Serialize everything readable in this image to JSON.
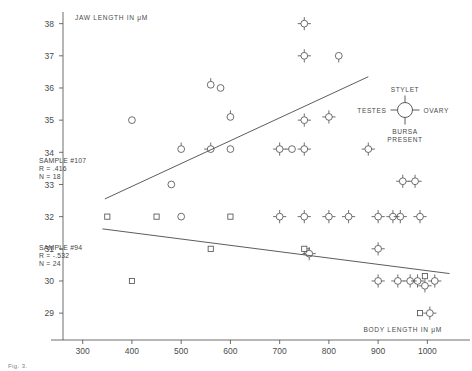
{
  "figure": {
    "background": "#ffffff",
    "ink_color": "#4a4a4a"
  },
  "axes": {
    "y_title": "JAW LENGTH IN μM",
    "x_title": "BODY LENGTH IN μM",
    "y_ticks": [
      "38",
      "37",
      "36",
      "35",
      "34",
      "33",
      "32",
      "31",
      "30",
      "29"
    ],
    "x_ticks": [
      "300",
      "400",
      "500",
      "600",
      "700",
      "800",
      "900",
      "1000"
    ]
  },
  "annotations": {
    "upper": {
      "sample": "SAMPLE #107",
      "r": "R =  .416",
      "n": "N =  18"
    },
    "lower": {
      "sample": "SAMPLE #94",
      "r": "R = -.532",
      "n": "N =  24"
    }
  },
  "legend": {
    "top_label": "STYLET",
    "left_label": "TESTES",
    "right_label": "OVARY",
    "bottom_label_line1": "BURSA",
    "bottom_label_line2": "PRESENT"
  },
  "caption": "Fig. 3.",
  "chart_data": {
    "type": "scatter",
    "title": "",
    "xlabel": "BODY LENGTH IN μM",
    "ylabel": "JAW LENGTH IN μM",
    "xlim": [
      260,
      1050
    ],
    "ylim": [
      28.6,
      38.3
    ],
    "grid": false,
    "legend_position": "top-right",
    "series": [
      {
        "name": "SAMPLE #107",
        "marker": "circle",
        "r": 0.416,
        "n": 18,
        "points": [
          {
            "x": 400,
            "y": 35.0,
            "ticks": []
          },
          {
            "x": 480,
            "y": 33.0,
            "ticks": []
          },
          {
            "x": 500,
            "y": 34.1,
            "ticks": [
              "top"
            ]
          },
          {
            "x": 560,
            "y": 36.1,
            "ticks": [
              "top"
            ]
          },
          {
            "x": 580,
            "y": 36.0,
            "ticks": []
          },
          {
            "x": 560,
            "y": 34.1,
            "ticks": [
              "top",
              "left"
            ]
          },
          {
            "x": 600,
            "y": 34.1,
            "ticks": []
          },
          {
            "x": 600,
            "y": 35.1,
            "ticks": [
              "top"
            ]
          },
          {
            "x": 700,
            "y": 34.1,
            "ticks": [
              "top",
              "left",
              "right",
              "bottom"
            ]
          },
          {
            "x": 725,
            "y": 34.1,
            "ticks": [
              "left"
            ]
          },
          {
            "x": 750,
            "y": 38.0,
            "ticks": [
              "top",
              "left",
              "right",
              "bottom"
            ]
          },
          {
            "x": 750,
            "y": 37.0,
            "ticks": [
              "top",
              "left",
              "right",
              "bottom"
            ]
          },
          {
            "x": 750,
            "y": 35.0,
            "ticks": [
              "top",
              "left",
              "right",
              "bottom"
            ]
          },
          {
            "x": 750,
            "y": 34.1,
            "ticks": [
              "top",
              "left",
              "right",
              "bottom"
            ]
          },
          {
            "x": 820,
            "y": 37.0,
            "ticks": [
              "bottom"
            ]
          },
          {
            "x": 800,
            "y": 35.1,
            "ticks": [
              "top",
              "left",
              "right",
              "bottom"
            ]
          },
          {
            "x": 880,
            "y": 34.1,
            "ticks": [
              "top",
              "left",
              "right",
              "bottom"
            ]
          },
          {
            "x": 950,
            "y": 33.1,
            "ticks": [
              "top",
              "left",
              "right",
              "bottom"
            ]
          },
          {
            "x": 975,
            "y": 33.1,
            "ticks": [
              "top",
              "left",
              "right",
              "bottom"
            ]
          }
        ],
        "regression_line": {
          "x1": 345,
          "y1": 32.55,
          "x2": 880,
          "y2": 36.35
        }
      },
      {
        "name": "SAMPLE #94",
        "marker": "square",
        "r": -0.532,
        "n": 24,
        "points": [
          {
            "x": 350,
            "y": 32.0,
            "marker": "square",
            "ticks": []
          },
          {
            "x": 400,
            "y": 30.0,
            "marker": "square",
            "ticks": []
          },
          {
            "x": 450,
            "y": 32.0,
            "marker": "square",
            "ticks": []
          },
          {
            "x": 500,
            "y": 32.0,
            "marker": "circle",
            "ticks": []
          },
          {
            "x": 560,
            "y": 31.0,
            "marker": "square",
            "ticks": []
          },
          {
            "x": 600,
            "y": 32.0,
            "marker": "square",
            "ticks": []
          },
          {
            "x": 700,
            "y": 32.0,
            "marker": "circle",
            "ticks": [
              "top",
              "left",
              "right",
              "bottom"
            ]
          },
          {
            "x": 750,
            "y": 32.0,
            "marker": "circle",
            "ticks": [
              "top",
              "left",
              "right",
              "bottom"
            ]
          },
          {
            "x": 750,
            "y": 31.0,
            "marker": "square",
            "ticks": [
              "bottom",
              "right"
            ]
          },
          {
            "x": 760,
            "y": 30.85,
            "marker": "circle",
            "ticks": [
              "top",
              "left",
              "right",
              "bottom"
            ]
          },
          {
            "x": 800,
            "y": 32.0,
            "marker": "circle",
            "ticks": [
              "top",
              "left",
              "right",
              "bottom"
            ]
          },
          {
            "x": 840,
            "y": 32.0,
            "marker": "circle",
            "ticks": [
              "top",
              "left",
              "right",
              "bottom"
            ]
          },
          {
            "x": 900,
            "y": 32.0,
            "marker": "circle",
            "ticks": [
              "top",
              "left",
              "right",
              "bottom"
            ]
          },
          {
            "x": 930,
            "y": 32.0,
            "marker": "circle",
            "ticks": [
              "top",
              "left",
              "right",
              "bottom"
            ]
          },
          {
            "x": 945,
            "y": 32.0,
            "marker": "circle",
            "ticks": [
              "top",
              "left",
              "right",
              "bottom"
            ]
          },
          {
            "x": 985,
            "y": 32.0,
            "marker": "circle",
            "ticks": [
              "top",
              "left",
              "right",
              "bottom"
            ]
          },
          {
            "x": 900,
            "y": 31.0,
            "marker": "circle",
            "ticks": [
              "top",
              "left",
              "right",
              "bottom"
            ]
          },
          {
            "x": 900,
            "y": 30.0,
            "marker": "circle",
            "ticks": [
              "top",
              "left",
              "right",
              "bottom"
            ]
          },
          {
            "x": 940,
            "y": 30.0,
            "marker": "circle",
            "ticks": [
              "top",
              "left",
              "right",
              "bottom"
            ]
          },
          {
            "x": 965,
            "y": 30.0,
            "marker": "circle",
            "ticks": [
              "top",
              "left",
              "right",
              "bottom"
            ]
          },
          {
            "x": 980,
            "y": 30.0,
            "marker": "circle",
            "ticks": [
              "top",
              "left",
              "right",
              "bottom"
            ]
          },
          {
            "x": 995,
            "y": 30.15,
            "marker": "square",
            "ticks": []
          },
          {
            "x": 995,
            "y": 29.85,
            "marker": "circle",
            "ticks": [
              "top",
              "left",
              "right",
              "bottom"
            ]
          },
          {
            "x": 1015,
            "y": 30.0,
            "marker": "circle",
            "ticks": [
              "top",
              "left",
              "right",
              "bottom"
            ]
          },
          {
            "x": 985,
            "y": 29.0,
            "marker": "square",
            "ticks": []
          },
          {
            "x": 1005,
            "y": 29.0,
            "marker": "circle",
            "ticks": [
              "top",
              "left",
              "right",
              "bottom"
            ]
          }
        ],
        "regression_line": {
          "x1": 340,
          "y1": 31.62,
          "x2": 1045,
          "y2": 30.23
        }
      }
    ]
  }
}
